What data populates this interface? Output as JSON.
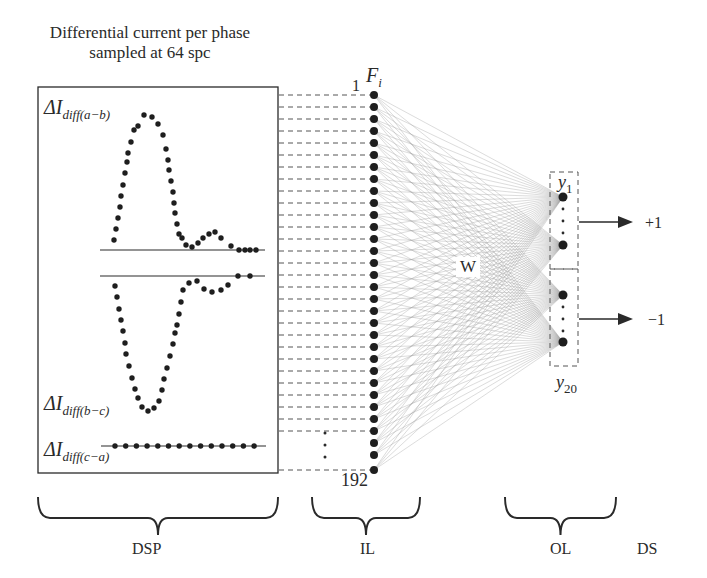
{
  "title": {
    "line1": "Differential current per phase",
    "line2": "sampled at 64 spc"
  },
  "signals": [
    {
      "symbol": "ΔI",
      "subscript": "diff(a−b)"
    },
    {
      "symbol": "ΔI",
      "subscript": "diff(b−c)"
    },
    {
      "symbol": "ΔI",
      "subscript": "diff(c−a)"
    }
  ],
  "input_layer": {
    "first_index": "1",
    "last_index": "192",
    "feature_symbol": "F",
    "feature_subscript": "i",
    "visible_nodes": 32
  },
  "weights_label": "W",
  "output_layer": {
    "first_label": "y",
    "first_subscript": "1",
    "last_label": "y",
    "last_subscript": "20",
    "visible_nodes": 4
  },
  "outputs": {
    "positive": "+1",
    "negative": "−1"
  },
  "stages": {
    "dsp": "DSP",
    "il": "IL",
    "ol": "OL",
    "ds": "DS"
  },
  "colors": {
    "ink": "#2a2a2a",
    "dot": "#1e1e1e",
    "connection": "#7a7a7a",
    "dash": "#555555"
  }
}
